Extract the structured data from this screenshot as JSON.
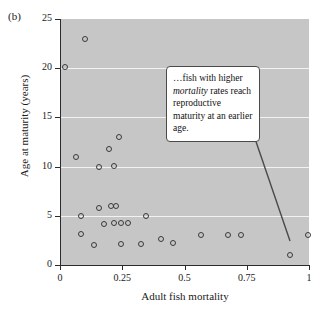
{
  "figure": {
    "panel_label": "(b)"
  },
  "annotation": {
    "text_part1": "…fish with higher ",
    "text_emphasis": "mortality",
    "text_part2": " rates reach reproductive maturity at an earlier age."
  },
  "chart_data": {
    "type": "scatter",
    "title": "",
    "xlabel": "Adult fish mortality",
    "ylabel": "Age at maturity (years)",
    "xlim": [
      0,
      1
    ],
    "ylim": [
      0,
      25
    ],
    "xticks": [
      0,
      0.25,
      0.5,
      0.75,
      1
    ],
    "xtick_labels": [
      "0",
      "0.25",
      "0.5",
      "0.75",
      "1"
    ],
    "yticks": [
      0,
      5,
      10,
      15,
      20,
      25
    ],
    "ytick_labels": [
      "0",
      "5",
      "10",
      "15",
      "20",
      "25"
    ],
    "gridlines_y": [
      5,
      10,
      15,
      20
    ],
    "grid": true,
    "grid_color": "#f2f2f2",
    "plot_background": "#c6c6c6",
    "marker": "open-circle",
    "marker_color": "#3a3a3a",
    "points": [
      {
        "x": 0.02,
        "y": 20.1
      },
      {
        "x": 0.1,
        "y": 23.0
      },
      {
        "x": 0.065,
        "y": 11.0
      },
      {
        "x": 0.195,
        "y": 11.8
      },
      {
        "x": 0.235,
        "y": 13.0
      },
      {
        "x": 0.155,
        "y": 10.0
      },
      {
        "x": 0.215,
        "y": 10.1
      },
      {
        "x": 0.085,
        "y": 5.0
      },
      {
        "x": 0.155,
        "y": 5.8
      },
      {
        "x": 0.205,
        "y": 6.0
      },
      {
        "x": 0.225,
        "y": 6.0
      },
      {
        "x": 0.085,
        "y": 3.1
      },
      {
        "x": 0.135,
        "y": 2.0
      },
      {
        "x": 0.175,
        "y": 4.2
      },
      {
        "x": 0.215,
        "y": 4.3
      },
      {
        "x": 0.245,
        "y": 4.3
      },
      {
        "x": 0.275,
        "y": 4.3
      },
      {
        "x": 0.245,
        "y": 2.1
      },
      {
        "x": 0.325,
        "y": 2.1
      },
      {
        "x": 0.345,
        "y": 5.0
      },
      {
        "x": 0.405,
        "y": 2.6
      },
      {
        "x": 0.455,
        "y": 2.2
      },
      {
        "x": 0.565,
        "y": 3.0
      },
      {
        "x": 0.675,
        "y": 3.0
      },
      {
        "x": 0.725,
        "y": 3.0
      },
      {
        "x": 0.925,
        "y": 1.0
      },
      {
        "x": 0.995,
        "y": 3.0
      }
    ]
  }
}
